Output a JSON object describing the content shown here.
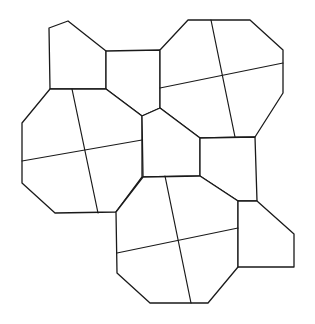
{
  "diagram": {
    "type": "geometric-tiling",
    "line_color": "#1a1a1a",
    "fill_color": "#ffffff",
    "tiles": [
      {
        "name": "top-left-pentagon",
        "points": [
          [
            49,
            28
          ],
          [
            68,
            21
          ],
          [
            106,
            51
          ],
          [
            106,
            89
          ],
          [
            50,
            89
          ]
        ]
      },
      {
        "name": "top-square",
        "points": [
          [
            106,
            51
          ],
          [
            160,
            50
          ],
          [
            160,
            108
          ],
          [
            142,
            116
          ],
          [
            106,
            89
          ]
        ]
      },
      {
        "name": "top-right-octagon",
        "points": [
          [
            188,
            20
          ],
          [
            250,
            20
          ],
          [
            283,
            50
          ],
          [
            283,
            93
          ],
          [
            255,
            137
          ],
          [
            200,
            138
          ],
          [
            160,
            108
          ],
          [
            160,
            50
          ]
        ]
      },
      {
        "name": "left-octagon",
        "points": [
          [
            50,
            89
          ],
          [
            106,
            89
          ],
          [
            142,
            116
          ],
          [
            142,
            177
          ],
          [
            116,
            212
          ],
          [
            55,
            213
          ],
          [
            22,
            183
          ],
          [
            22,
            123
          ]
        ]
      },
      {
        "name": "center-pentagon",
        "points": [
          [
            142,
            116
          ],
          [
            160,
            108
          ],
          [
            200,
            138
          ],
          [
            200,
            176
          ],
          [
            143,
            177
          ]
        ]
      },
      {
        "name": "right-square",
        "points": [
          [
            200,
            138
          ],
          [
            255,
            137
          ],
          [
            257,
            201
          ],
          [
            238,
            201
          ],
          [
            200,
            176
          ]
        ]
      },
      {
        "name": "bottom-octagon",
        "points": [
          [
            143,
            177
          ],
          [
            200,
            176
          ],
          [
            238,
            201
          ],
          [
            238,
            267
          ],
          [
            208,
            303
          ],
          [
            150,
            303
          ],
          [
            117,
            273
          ],
          [
            116,
            212
          ]
        ]
      },
      {
        "name": "bottom-right-pentagon",
        "points": [
          [
            238,
            201
          ],
          [
            257,
            201
          ],
          [
            294,
            234
          ],
          [
            294,
            267
          ],
          [
            238,
            267
          ]
        ]
      }
    ],
    "cuts": [
      {
        "name": "top-right-cut-vertical",
        "from": [
          211,
          20
        ],
        "to": [
          235,
          137
        ]
      },
      {
        "name": "top-right-cut-horizontal",
        "from": [
          160,
          88
        ],
        "to": [
          283,
          63
        ]
      },
      {
        "name": "left-cut-vertical",
        "from": [
          72,
          89
        ],
        "to": [
          98,
          213
        ]
      },
      {
        "name": "left-cut-horizontal",
        "from": [
          22,
          161
        ],
        "to": [
          142,
          140
        ]
      },
      {
        "name": "bottom-cut-vertical",
        "from": [
          165,
          176
        ],
        "to": [
          191,
          303
        ]
      },
      {
        "name": "bottom-cut-horizontal",
        "from": [
          117,
          253
        ],
        "to": [
          238,
          228
        ]
      }
    ]
  }
}
